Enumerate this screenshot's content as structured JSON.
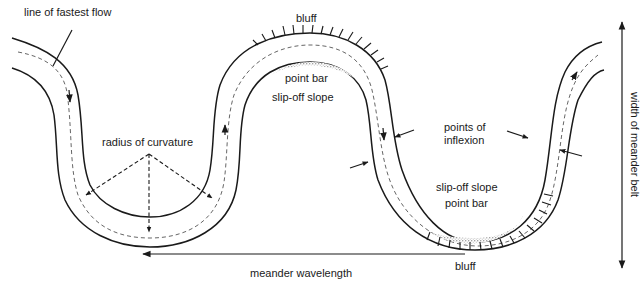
{
  "diagram": {
    "labels": {
      "line_of_fastest_flow": "line of fastest flow",
      "bluff_top": "bluff",
      "point_bar_top": "point bar",
      "slip_off_slope_top": "slip-off slope",
      "radius_of_curvature": "radius of curvature",
      "points_of_inflexion_line1": "points of",
      "points_of_inflexion_line2": "inflexion",
      "slip_off_slope_bottom": "slip-off slope",
      "point_bar_bottom": "point bar",
      "bluff_bottom": "bluff",
      "meander_wavelength": "meander wavelength",
      "width_of_meander_belt": "width of meander belt"
    },
    "colors": {
      "line": "#1a1a1a",
      "flow_line": "#555555",
      "point_bar_stipple": "#333333",
      "background": "#ffffff"
    },
    "icons": {
      "flow_arrow": "arrowhead-triangle",
      "inflexion_arrow": "arrow-pointer",
      "belt_arrow": "double-headed-vertical-arrow",
      "wavelength_arrow": "left-arrow"
    }
  }
}
